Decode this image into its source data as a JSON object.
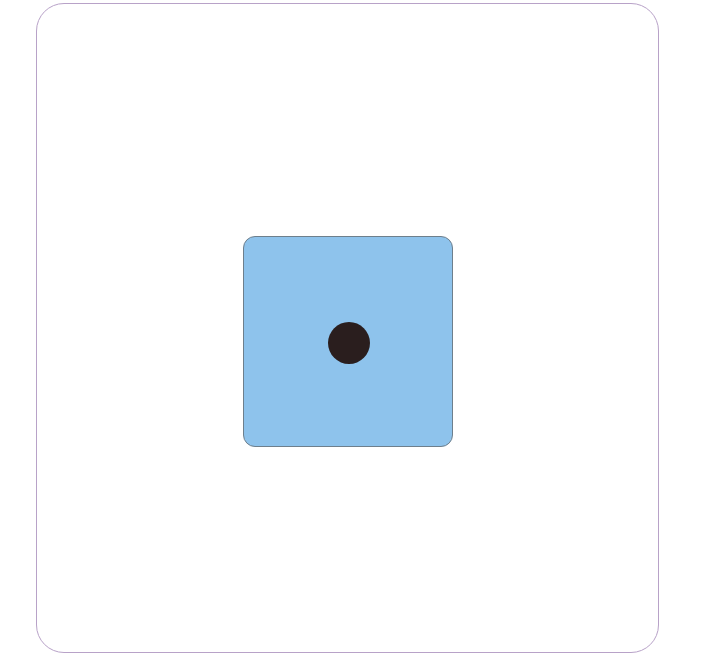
{
  "card": {
    "border_color": "#b8a2c8",
    "background": "#ffffff"
  },
  "die": {
    "face_value": 1,
    "face_color": "#8ec3ec",
    "pip_color": "#2a1e1e",
    "pips": [
      {
        "cx": 348,
        "cy": 342,
        "r": 21
      }
    ]
  }
}
